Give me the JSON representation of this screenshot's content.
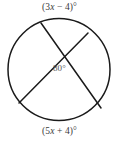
{
  "figure": {
    "kind": "circle-with-two-intersecting-chords",
    "background_color": "#ffffff",
    "stroke_color": "#1a1a1a",
    "text_color": "#3a3a3a",
    "circle": {
      "center_x": 59,
      "center_y": 69.5,
      "radius": 51
    },
    "chords": [
      {
        "name": "chord-a",
        "x1": 41,
        "y1": 23,
        "x2": 101,
        "y2": 108
      },
      {
        "name": "chord-b",
        "x1": 88,
        "y1": 33,
        "x2": 19,
        "y2": 103
      }
    ],
    "intersection": {
      "x": 60,
      "y": 57
    },
    "labels": {
      "arc_top": "(3x − 4)°",
      "arc_bottom": "(5x + 4)°",
      "angle_center": "80°"
    }
  },
  "chart_data": {
    "type": "diagram",
    "title": "",
    "shape": "circle",
    "annotations": [
      {
        "role": "arc-measure-top",
        "text": "(3x − 4)°",
        "expression": "3x - 4",
        "unit": "degrees"
      },
      {
        "role": "arc-measure-bottom",
        "text": "(5x + 4)°",
        "expression": "5x + 4",
        "unit": "degrees"
      },
      {
        "role": "intersection-angle",
        "text": "80°",
        "value": 80,
        "unit": "degrees"
      }
    ]
  }
}
